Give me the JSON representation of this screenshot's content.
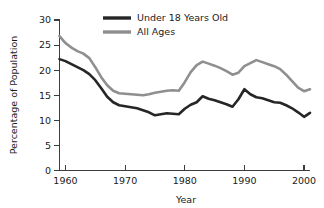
{
  "chart_data": {
    "type": "line",
    "title": "",
    "xlabel": "Year",
    "ylabel": "Percentage of Population",
    "xlim": [
      1959,
      2001
    ],
    "ylim": [
      0,
      30
    ],
    "xticks": [
      1960,
      1970,
      1980,
      1990,
      2000
    ],
    "yticks": [
      0,
      5,
      10,
      15,
      20,
      25,
      30
    ],
    "grid": false,
    "legend_position": "top-center",
    "x": [
      1959,
      1960,
      1961,
      1962,
      1963,
      1964,
      1965,
      1966,
      1967,
      1968,
      1969,
      1970,
      1971,
      1972,
      1973,
      1974,
      1975,
      1976,
      1977,
      1978,
      1979,
      1980,
      1981,
      1982,
      1983,
      1984,
      1985,
      1986,
      1987,
      1988,
      1989,
      1990,
      1991,
      1992,
      1993,
      1994,
      1995,
      1996,
      1997,
      1998,
      1999,
      2000,
      2001
    ],
    "series": [
      {
        "name": "Under 18 Years Old",
        "color": "#262626",
        "values": [
          22.2,
          21.8,
          21.2,
          20.6,
          20.0,
          19.2,
          18.0,
          16.4,
          14.7,
          13.6,
          13.0,
          12.8,
          12.6,
          12.4,
          12.0,
          11.6,
          11.0,
          11.2,
          11.4,
          11.3,
          11.2,
          12.3,
          13.1,
          13.6,
          14.8,
          14.3,
          14.0,
          13.6,
          13.2,
          12.7,
          14.2,
          16.2,
          15.2,
          14.6,
          14.4,
          14.0,
          13.6,
          13.5,
          13.0,
          12.4,
          11.6,
          10.7,
          11.5
        ]
      },
      {
        "name": "All Ages",
        "color": "#8f8f8f",
        "values": [
          26.8,
          25.4,
          24.5,
          23.8,
          23.3,
          22.4,
          20.6,
          18.6,
          17.0,
          15.9,
          15.4,
          15.3,
          15.2,
          15.1,
          15.0,
          15.2,
          15.5,
          15.7,
          15.9,
          16.0,
          15.9,
          17.6,
          19.6,
          21.0,
          21.7,
          21.3,
          20.9,
          20.4,
          19.8,
          19.1,
          19.5,
          20.8,
          21.4,
          22.0,
          21.6,
          21.2,
          20.8,
          20.2,
          19.1,
          17.8,
          16.5,
          15.8,
          16.2
        ]
      }
    ],
    "legend": [
      {
        "label": "Under 18 Years Old",
        "color": "#262626",
        "width": 3.4
      },
      {
        "label": "All Ages",
        "color": "#8f8f8f",
        "width": 3.4
      }
    ]
  }
}
